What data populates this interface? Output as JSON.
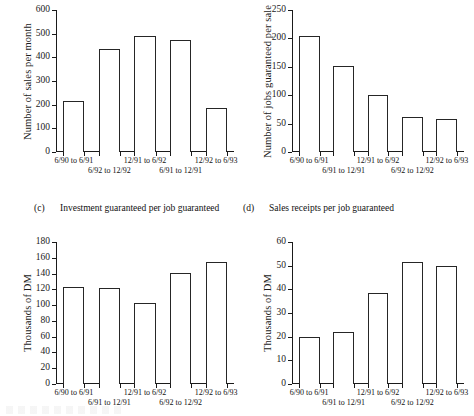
{
  "figure": {
    "panels": [
      {
        "id": "a",
        "caption_tag": "",
        "caption_text": "",
        "chart_data": {
          "type": "bar",
          "title": "",
          "xlabel": "",
          "ylabel": "Number of sales per month",
          "ylim": [
            0,
            600
          ],
          "yticks": [
            0,
            100,
            200,
            300,
            400,
            500,
            600
          ],
          "ytick_labels": [
            "0",
            "100",
            "200",
            "300",
            "400",
            "500",
            "600"
          ],
          "grid": false,
          "legend": "none",
          "categories": [
            "6/90 to 6/91",
            "6/92 to 12/92",
            "12/91 to 6/92",
            "6/91 to 12/91",
            "12/92 to 6/93"
          ],
          "category_rows": [
            0,
            1,
            0,
            1,
            0
          ],
          "values": [
            215,
            437,
            490,
            472,
            188
          ]
        }
      },
      {
        "id": "b",
        "caption_tag": "",
        "caption_text": "",
        "chart_data": {
          "type": "bar",
          "title": "",
          "xlabel": "",
          "ylabel": "Number of jobs guaranteed per sale",
          "ylim": [
            0,
            250
          ],
          "yticks": [
            0,
            50,
            100,
            150,
            200,
            250
          ],
          "ytick_labels": [
            "0",
            "50",
            "100",
            "150",
            "200",
            "250"
          ],
          "grid": false,
          "legend": "none",
          "categories": [
            "6/90 to 6/91",
            "6/91 to 12/91",
            "12/91 to 6/92",
            "6/92 to 12/92",
            "12/92 to 6/93"
          ],
          "category_rows": [
            0,
            1,
            0,
            1,
            0
          ],
          "values": [
            205,
            152,
            100,
            62,
            58
          ]
        }
      },
      {
        "id": "c",
        "caption_tag": "(c)",
        "caption_text": "Investment guaranteed per job guaranteed",
        "chart_data": {
          "type": "bar",
          "title": "Investment guaranteed per job guaranteed",
          "xlabel": "",
          "ylabel": "Thousands of DM",
          "ylim": [
            0,
            180
          ],
          "yticks": [
            0,
            20,
            40,
            60,
            80,
            100,
            120,
            140,
            160,
            180
          ],
          "ytick_labels": [
            "0",
            "20",
            "40",
            "60",
            "80",
            "100",
            "120",
            "140",
            "160",
            "180"
          ],
          "grid": false,
          "legend": "none",
          "categories": [
            "6/90 to 6/91",
            "6/91 to 12/91",
            "12/91 to 6/92",
            "6/92 to 12/92",
            "12/92 to 6/93"
          ],
          "category_rows": [
            0,
            1,
            0,
            1,
            0
          ],
          "values": [
            123,
            122,
            103,
            141,
            155
          ]
        }
      },
      {
        "id": "d",
        "caption_tag": "(d)",
        "caption_text": "Sales receipts per job guaranteed",
        "chart_data": {
          "type": "bar",
          "title": "Sales receipts per job guaranteed",
          "xlabel": "",
          "ylabel": "Thousands of DM",
          "ylim": [
            0,
            60
          ],
          "yticks": [
            0,
            10,
            20,
            30,
            40,
            50,
            60
          ],
          "ytick_labels": [
            "0",
            "10",
            "20",
            "30",
            "40",
            "50",
            "60"
          ],
          "grid": false,
          "legend": "none",
          "categories": [
            "6/90 to 6/91",
            "6/91 to 12/91",
            "12/91 to 6/92",
            "6/92 to 12/92",
            "12/92 to 6/93"
          ],
          "category_rows": [
            0,
            1,
            0,
            1,
            0
          ],
          "values": [
            20,
            22,
            38.5,
            51.5,
            50
          ]
        }
      }
    ]
  }
}
